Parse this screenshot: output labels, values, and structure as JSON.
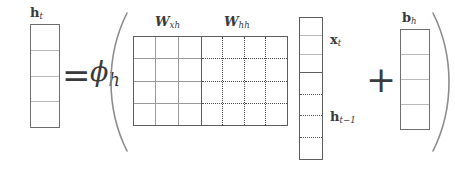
{
  "equation": {
    "description": "h_t = phi_h ( [W_xh W_hh] [x_t ; h_t-1] + b_h )",
    "operators": {
      "equals": "=",
      "plus": "+",
      "open_paren": "(",
      "close_paren": ")"
    },
    "activation": {
      "base": "ϕ",
      "subscript": "h"
    },
    "output_vector": {
      "base": "h",
      "subscript": "t",
      "cells": 4
    },
    "weight_matrix": {
      "rows": 4,
      "blocks": [
        {
          "id": "wxh",
          "base": "W",
          "subscript": "xh",
          "columns": 3,
          "grid_style": "solid"
        },
        {
          "id": "whh",
          "base": "W",
          "subscript": "hh",
          "columns": 4,
          "grid_style": "dotted"
        }
      ]
    },
    "input_stack": {
      "segments": [
        {
          "id": "xt",
          "base": "x",
          "subscript": "t",
          "cells": 3,
          "grid_style": "solid"
        },
        {
          "id": "htm1",
          "base": "h",
          "subscript": "t−1",
          "cells": 4,
          "grid_style": "dotted"
        }
      ]
    },
    "bias_vector": {
      "base": "b",
      "subscript": "h",
      "cells": 4
    }
  },
  "colors": {
    "ink": "#3a3a3a",
    "outline_strong": "#5d5d5d",
    "outline_medium": "#6f6f6f",
    "grid_light": "#b9b9b9",
    "grid_dotted": "#4a4a4a",
    "background": "#ffffff"
  }
}
